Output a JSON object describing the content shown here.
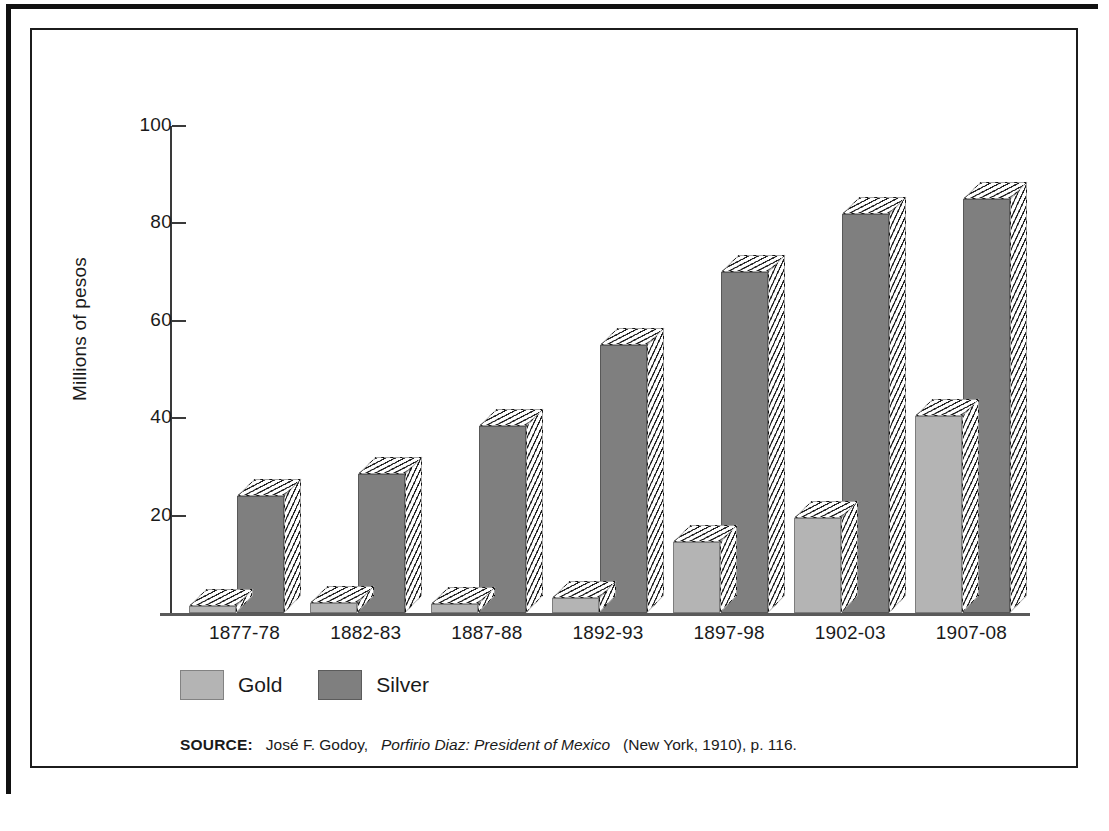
{
  "chart_data": {
    "type": "bar",
    "title": "",
    "subtitle": "",
    "xlabel": "",
    "ylabel": "Millions of pesos",
    "categories": [
      "1877-78",
      "1882-83",
      "1887-88",
      "1892-93",
      "1897-98",
      "1902-03",
      "1907-08"
    ],
    "series": [
      {
        "name": "Gold",
        "color": "#b4b4b4",
        "values": [
          1.5,
          2.0,
          1.8,
          3.0,
          14.5,
          19.5,
          40.5
        ]
      },
      {
        "name": "Silver",
        "color": "#7f7f7f",
        "values": [
          24.0,
          28.5,
          38.5,
          55.0,
          70.0,
          82.0,
          85.0
        ]
      }
    ],
    "ylim": [
      0,
      100
    ],
    "y_ticks": [
      0,
      20,
      40,
      60,
      80,
      100
    ],
    "y_tick_labels": [
      "",
      "20",
      "40",
      "60",
      "80",
      "100"
    ],
    "grid": false,
    "legend_position": "bottom-left",
    "style": "3d-extruded-hatched"
  },
  "legend": {
    "items": [
      {
        "label": "Gold",
        "color": "#b4b4b4"
      },
      {
        "label": "Silver",
        "color": "#7f7f7f"
      }
    ]
  },
  "source": {
    "prefix": "SOURCE:",
    "author": "José F. Godoy,",
    "title": "Porfirio Diaz: President of Mexico",
    "publication": "(New York, 1910), p. 116."
  },
  "colors": {
    "gold": "#b4b4b4",
    "silver": "#7f7f7f",
    "axis": "#3a3a3a",
    "frame": "#1c1c1c",
    "background": "#ffffff"
  }
}
